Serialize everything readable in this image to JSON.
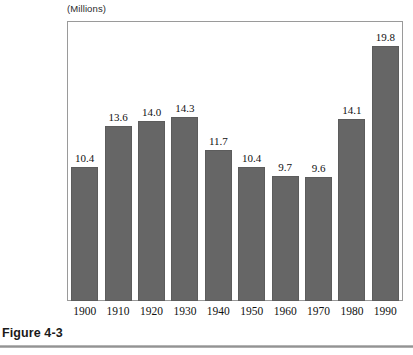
{
  "figure": {
    "caption": "Figure 4-3",
    "axis_unit_label": "(Millions)"
  },
  "colors": {
    "bar_fill": "#666666",
    "bar_border": "#5c5c5c",
    "frame": "#9a9a9a",
    "text": "#111111",
    "rule": "#8f8f8f",
    "background": "#ffffff"
  },
  "chart_data": {
    "type": "bar",
    "title": "",
    "subtitle": "",
    "xlabel": "",
    "ylabel": "(Millions)",
    "ylim": [
      0,
      19.8
    ],
    "grid": false,
    "legend": "none",
    "axis_unit": "(Millions)",
    "categories": [
      "1900",
      "1910",
      "1920",
      "1930",
      "1940",
      "1950",
      "1960",
      "1970",
      "1980",
      "1990"
    ],
    "values": [
      10.4,
      13.6,
      14.0,
      14.3,
      11.7,
      10.4,
      9.7,
      9.6,
      14.1,
      19.8
    ],
    "value_labels": [
      "10.4",
      "13.6",
      "14.0",
      "14.3",
      "11.7",
      "10.4",
      "9.7",
      "9.6",
      "14.1",
      "19.8"
    ],
    "points": [
      {
        "category": "1900",
        "value": 10.4,
        "label": "10.4"
      },
      {
        "category": "1910",
        "value": 13.6,
        "label": "13.6"
      },
      {
        "category": "1920",
        "value": 14.0,
        "label": "14.0"
      },
      {
        "category": "1930",
        "value": 14.3,
        "label": "14.3"
      },
      {
        "category": "1940",
        "value": 11.7,
        "label": "11.7"
      },
      {
        "category": "1950",
        "value": 10.4,
        "label": "10.4"
      },
      {
        "category": "1960",
        "value": 9.7,
        "label": "9.7"
      },
      {
        "category": "1970",
        "value": 9.6,
        "label": "9.6"
      },
      {
        "category": "1980",
        "value": 14.1,
        "label": "14.1"
      },
      {
        "category": "1990",
        "value": 19.8,
        "label": "19.8"
      }
    ]
  }
}
